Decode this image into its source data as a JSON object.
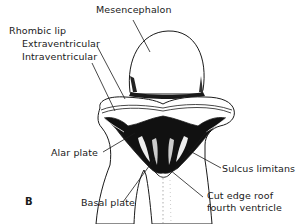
{
  "figure": {
    "panel_letter": "B",
    "labels": {
      "mesencephalon": "Mesencephalon",
      "rhombic_lip": "Rhombic lip",
      "extraventricular": "Extraventricular",
      "intraventricular": "Intraventricular",
      "alar_plate": "Alar plate",
      "basal_plate": "Basal plate",
      "sulcus_limitans": "Sulcus limitans",
      "cut_edge_line1": "Cut edge roof",
      "cut_edge_line2": "fourth ventricle"
    },
    "colors": {
      "ink": "#1a1a1a",
      "background": "#ffffff",
      "shading": "#111111"
    }
  }
}
